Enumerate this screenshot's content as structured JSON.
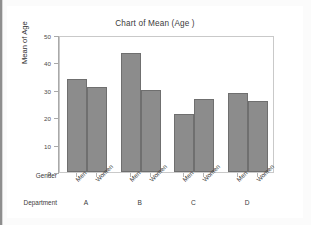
{
  "chart_data": {
    "type": "bar",
    "title": "Chart of Mean (Age )",
    "xlabel": "",
    "ylabel": "Mean of Age",
    "ylim": [
      0,
      50
    ],
    "yticks": [
      0,
      10,
      20,
      30,
      40,
      50
    ],
    "grid": false,
    "legend_position": "none",
    "group_axis_labels": {
      "inner": "Gender",
      "outer": "Department"
    },
    "categories": [
      "A",
      "B",
      "C",
      "D"
    ],
    "subcategories": [
      "Men",
      "Women"
    ],
    "series": [
      {
        "name": "Men",
        "values": [
          34,
          43.5,
          21,
          29
        ]
      },
      {
        "name": "Women",
        "values": [
          31,
          30,
          26.5,
          26
        ]
      }
    ],
    "bars": [
      {
        "department": "A",
        "gender": "Men",
        "value": 34
      },
      {
        "department": "A",
        "gender": "Women",
        "value": 31
      },
      {
        "department": "B",
        "gender": "Men",
        "value": 43.5
      },
      {
        "department": "B",
        "gender": "Women",
        "value": 30
      },
      {
        "department": "C",
        "gender": "Men",
        "value": 21
      },
      {
        "department": "C",
        "gender": "Women",
        "value": 26.5
      },
      {
        "department": "D",
        "gender": "Men",
        "value": 29
      },
      {
        "department": "D",
        "gender": "Women",
        "value": 26
      }
    ]
  },
  "style": {
    "bar_fill": "#8c8c8c",
    "bar_edge": "#6f6f6f",
    "plot_bg": "#ffffff",
    "card_bg": "#ffffff",
    "page_bg": "#fbfbfb",
    "axis_color": "#a9a9a9",
    "text_color": "#3a3a3a"
  },
  "yticks_text": [
    "50",
    "40",
    "30",
    "20",
    "10",
    "0"
  ],
  "gender_labels": [
    "Men",
    "Women",
    "Men",
    "Women",
    "Men",
    "Women",
    "Men",
    "Women"
  ],
  "dept_labels": [
    "A",
    "B",
    "C",
    "D"
  ]
}
